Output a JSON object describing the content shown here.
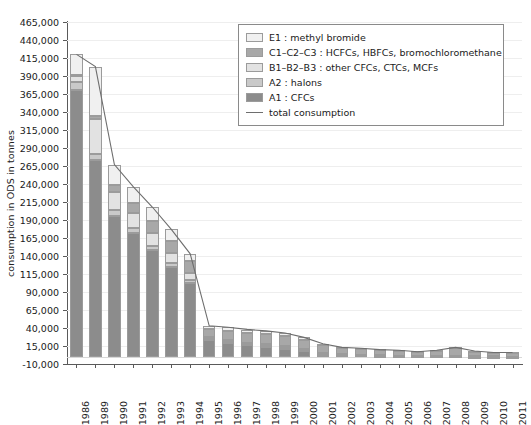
{
  "chart_data": {
    "type": "bar",
    "title": "",
    "subtitle": "",
    "xlabel": "",
    "ylabel": "consumption in ODS in tonnes",
    "ylim": [
      -10000,
      465000
    ],
    "ytick_step": 25000,
    "grid": true,
    "stacked": true,
    "legend_position": "top-right",
    "ytick_labels": [
      "465,000",
      "440,000",
      "415,000",
      "390,000",
      "365,000",
      "340,000",
      "315,000",
      "290,000",
      "265,000",
      "240,000",
      "215,000",
      "190,000",
      "165,000",
      "140,000",
      "115,000",
      "90,000",
      "65,000",
      "40,000",
      "15,000",
      "-10,000"
    ],
    "ytick_values": [
      465000,
      440000,
      415000,
      390000,
      365000,
      340000,
      315000,
      290000,
      265000,
      240000,
      215000,
      190000,
      165000,
      140000,
      115000,
      90000,
      65000,
      40000,
      15000,
      -10000
    ],
    "categories": [
      "1986",
      "1989",
      "1990",
      "1991",
      "1992",
      "1993",
      "1994",
      "1995",
      "1996",
      "1997",
      "1998",
      "1999",
      "2000",
      "2001",
      "2002",
      "2003",
      "2004",
      "2005",
      "2006",
      "2007",
      "2008",
      "2009",
      "2010",
      "2011"
    ],
    "series": [
      {
        "name": "A1 : CFCs",
        "key": "A1",
        "color": "#8c8c8c",
        "values": [
          370000,
          273000,
          196000,
          172000,
          148000,
          125000,
          102000,
          23000,
          19000,
          16000,
          14000,
          12000,
          9000,
          4000,
          2500,
          2000,
          1500,
          1200,
          900,
          700,
          500,
          400,
          300,
          200
        ]
      },
      {
        "name": "A2 : halons",
        "key": "A2",
        "color": "#c9c9c9",
        "values": [
          12000,
          9000,
          8000,
          7000,
          6000,
          5000,
          4000,
          1500,
          1300,
          1200,
          1000,
          900,
          700,
          400,
          300,
          250,
          200,
          150,
          120,
          100,
          80,
          60,
          50,
          40
        ]
      },
      {
        "name": "B1–B2–B3 : other CFCs, CTCs, MCFs",
        "key": "B",
        "color": "#e2e2e2",
        "values": [
          8000,
          48000,
          25000,
          21000,
          18000,
          14000,
          10000,
          3500,
          3000,
          2500,
          2200,
          1800,
          1200,
          700,
          500,
          400,
          300,
          250,
          200,
          150,
          120,
          100,
          80,
          60
        ]
      },
      {
        "name": "C1–C2–C3 : HCFCs, HBFCs, bromochloromethane",
        "key": "C",
        "color": "#a8a8a8",
        "values": [
          2000,
          5000,
          10000,
          13000,
          16000,
          17000,
          17000,
          10000,
          12000,
          13000,
          14000,
          14000,
          13000,
          11000,
          9000,
          9000,
          8000,
          7000,
          6000,
          8000,
          12000,
          7000,
          6000,
          6000
        ]
      },
      {
        "name": "E1 : methyl bromide",
        "key": "E1",
        "color": "#f0f0f0",
        "values": [
          28000,
          68000,
          28000,
          23000,
          20000,
          16000,
          10000,
          5000,
          6000,
          5000,
          5000,
          4000,
          3000,
          2000,
          1500,
          1200,
          900,
          700,
          500,
          400,
          300,
          200,
          150,
          100
        ]
      }
    ],
    "total_consumption": {
      "name": "total consumption",
      "color": "#6e6e6e",
      "values": [
        420000,
        403000,
        267000,
        236000,
        208000,
        177000,
        143000,
        43000,
        41000,
        38000,
        36000,
        33000,
        27000,
        18000,
        13000,
        12000,
        10000,
        9000,
        7000,
        9000,
        13000,
        8000,
        6000,
        6000
      ]
    }
  },
  "legend": {
    "items": [
      {
        "label": "E1 : methyl bromide",
        "type": "swatch",
        "color": "#f0f0f0",
        "icon": "legend-swatch-icon"
      },
      {
        "label": "C1–C2–C3 : HCFCs, HBFCs, bromochloromethane",
        "type": "swatch",
        "color": "#a8a8a8",
        "icon": "legend-swatch-icon"
      },
      {
        "label": "B1–B2–B3 : other CFCs, CTCs, MCFs",
        "type": "swatch",
        "color": "#e2e2e2",
        "icon": "legend-swatch-icon"
      },
      {
        "label": "A2 : halons",
        "type": "swatch",
        "color": "#c9c9c9",
        "icon": "legend-swatch-icon"
      },
      {
        "label": "A1 : CFCs",
        "type": "swatch",
        "color": "#8c8c8c",
        "icon": "legend-swatch-icon"
      },
      {
        "label": "total consumption",
        "type": "line",
        "color": "#6e6e6e",
        "icon": "legend-line-icon"
      }
    ]
  },
  "colors": {
    "axis": "#5a5a5a",
    "grid": "#eeeeee",
    "background": "#ffffff",
    "bar_outline": "#9b9b9b"
  }
}
